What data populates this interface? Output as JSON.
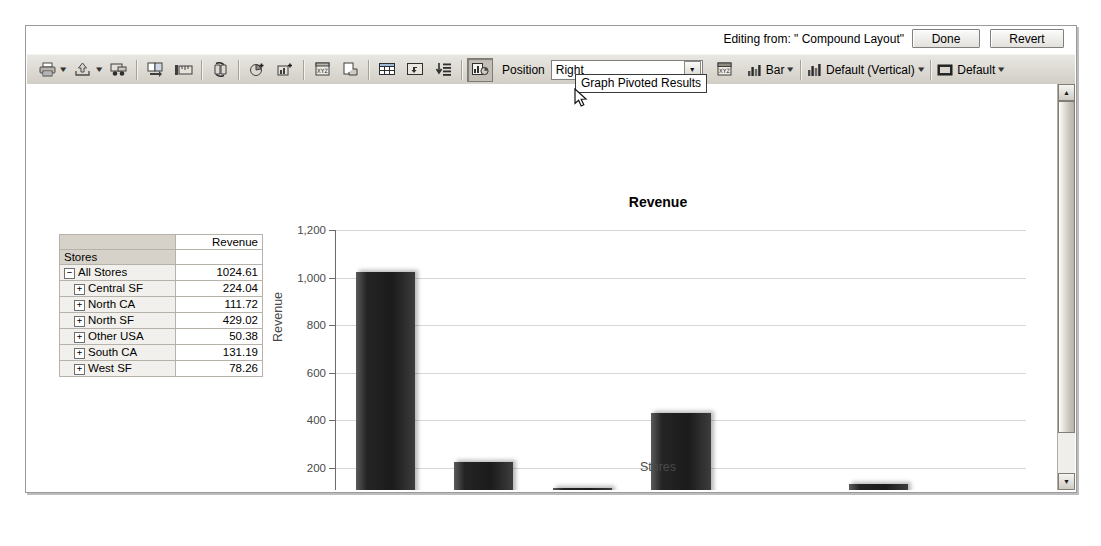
{
  "window": {
    "editing_from_label": "Editing from: \" Compound Layout\"",
    "done_label": "Done",
    "revert_label": "Revert"
  },
  "toolbar": {
    "position_label": "Position",
    "position_value": "Right",
    "graph_type_value": "Bar",
    "orientation_value": "Default (Vertical)",
    "style_value": "Default",
    "icons": [
      "print-icon",
      "export-icon",
      "download-data-icon",
      "book-icon",
      "ruler-icon",
      "refresh-icon",
      "pie-add-icon",
      "chart-add-icon",
      "abc-table-icon",
      "copy-page-icon",
      "table-grid-icon",
      "pivot-table-icon",
      "sort-icon",
      "graph-pivoted-results-icon",
      "calendar-xyz-icon"
    ]
  },
  "tooltip": {
    "text": "Graph Pivoted Results"
  },
  "pivot": {
    "corner": "",
    "measure_header": "Revenue",
    "row_dimension": "Stores",
    "rows": [
      {
        "label": "All Stores",
        "value": "1024.61",
        "level": 0,
        "expander": "−"
      },
      {
        "label": "Central SF",
        "value": "224.04",
        "level": 1,
        "expander": "+"
      },
      {
        "label": "North CA",
        "value": "111.72",
        "level": 1,
        "expander": "+"
      },
      {
        "label": "North SF",
        "value": "429.02",
        "level": 1,
        "expander": "+"
      },
      {
        "label": "Other USA",
        "value": "50.38",
        "level": 1,
        "expander": "+"
      },
      {
        "label": "South CA",
        "value": "131.19",
        "level": 1,
        "expander": "+"
      },
      {
        "label": "West SF",
        "value": "78.26",
        "level": 1,
        "expander": "+"
      }
    ]
  },
  "chart_data": {
    "type": "bar",
    "title": "Revenue",
    "xlabel": "Stores",
    "ylabel": "Revenue",
    "categories": [
      "All Stores",
      "Central SF",
      "North CA",
      "North SF",
      "Other USA",
      "South CA",
      "West SF"
    ],
    "values": [
      1024.61,
      224.04,
      111.72,
      429.02,
      50.38,
      131.19,
      78.26
    ],
    "ylim": [
      0,
      1200
    ],
    "yticks": [
      0,
      200,
      400,
      600,
      800,
      1000,
      1200
    ],
    "ytick_labels": [
      "0",
      "200",
      "400",
      "600",
      "800",
      "1,000",
      "1,200"
    ],
    "grid": true,
    "legend": false,
    "bar_color": "#1f1f1f"
  },
  "scrollbar": {
    "up_arrow": "▲",
    "down_arrow": "▼"
  }
}
